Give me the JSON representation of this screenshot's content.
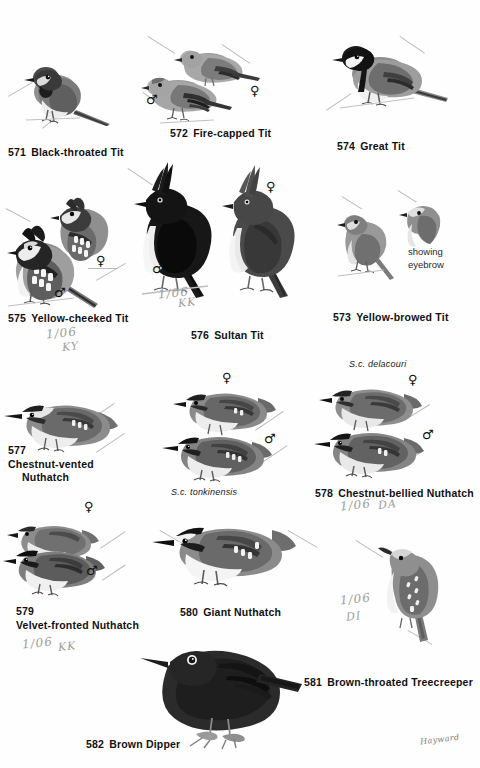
{
  "plate": {
    "type": "field-guide-illustration-plate",
    "signature": "Hayward",
    "species": [
      {
        "number": "571",
        "name": "Black-throated Tit"
      },
      {
        "number": "572",
        "name": "Fire-capped Tit"
      },
      {
        "number": "574",
        "name": "Great Tit"
      },
      {
        "number": "575",
        "name": "Yellow-cheeked Tit"
      },
      {
        "number": "576",
        "name": "Sultan Tit"
      },
      {
        "number": "573",
        "name": "Yellow-browed Tit"
      },
      {
        "number": "577",
        "name": "Chestnut-vented Nuthatch"
      },
      {
        "number": "578",
        "name": "Chestnut-bellied Nuthatch"
      },
      {
        "number": "579",
        "name": "Velvet-fronted Nuthatch"
      },
      {
        "number": "580",
        "name": "Giant Nuthatch"
      },
      {
        "number": "581",
        "name": "Brown-throated Treecreeper"
      },
      {
        "number": "582",
        "name": "Brown Dipper"
      }
    ],
    "captions": {
      "c571_num": "571",
      "c571_name": "Black-throated Tit",
      "c572_num": "572",
      "c572_name": "Fire-capped Tit",
      "c574_num": "574",
      "c574_name": "Great Tit",
      "c575_num": "575",
      "c575_name": "Yellow-cheeked Tit",
      "c576_num": "576",
      "c576_name": "Sultan Tit",
      "c573_num": "573",
      "c573_name": "Yellow-browed Tit",
      "c577_num": "577",
      "c577_name": "Chestnut-vented",
      "c577_name2": "Nuthatch",
      "c578_num": "578",
      "c578_name": "Chestnut-bellied Nuthatch",
      "c579_num": "579",
      "c579_name": "Velvet-fronted Nuthatch",
      "c580_num": "580",
      "c580_name": "Giant Nuthatch",
      "c581_num": "581",
      "c581_name": "Brown-throated Treecreeper",
      "c582_num": "582",
      "c582_name": "Brown Dipper"
    },
    "sublabels": {
      "tonkinensis": "S.c. tonkinensis",
      "delacouri": "S.c. delacouri"
    },
    "notes": {
      "showing_eyebrow": "showing\neyebrow"
    },
    "sex_symbols": {
      "male": "♂",
      "female": "♀"
    },
    "pencil_marks": [
      {
        "line1": "1/06",
        "line2": "KY"
      },
      {
        "line1": "1/06",
        "line2": "KK"
      },
      {
        "line1": "1/06",
        "line2": "DA"
      },
      {
        "line1": "1/06",
        "line2": "KK"
      },
      {
        "line1": "1/06",
        "line2": "DI"
      }
    ],
    "colors": {
      "paper": "#fefefe",
      "ink": "#111111",
      "leader_line": "#b9b9b9",
      "pencil": "#8d8d8d"
    }
  }
}
